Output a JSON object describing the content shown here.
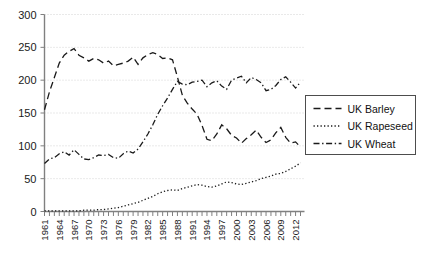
{
  "chart_data": {
    "type": "line",
    "title": "",
    "xlabel": "",
    "ylabel": "",
    "ylim": [
      0,
      300
    ],
    "yticks": [
      0,
      50,
      100,
      150,
      200,
      250,
      300
    ],
    "ytick_labels": [
      "0",
      "50",
      "100",
      "150",
      "200",
      "250",
      "300"
    ],
    "grid": true,
    "legend_position": "right",
    "xlim": [
      1961,
      2013
    ],
    "x": [
      1961,
      1962,
      1963,
      1964,
      1965,
      1966,
      1967,
      1968,
      1969,
      1970,
      1971,
      1972,
      1973,
      1974,
      1975,
      1976,
      1977,
      1978,
      1979,
      1980,
      1981,
      1982,
      1983,
      1984,
      1985,
      1986,
      1987,
      1988,
      1989,
      1990,
      1991,
      1992,
      1993,
      1994,
      1995,
      1996,
      1997,
      1998,
      1999,
      2000,
      2001,
      2002,
      2003,
      2004,
      2005,
      2006,
      2007,
      2008,
      2009,
      2010,
      2011,
      2012,
      2013
    ],
    "xtick_labels": [
      "1961",
      "1964",
      "1967",
      "1970",
      "1973",
      "1976",
      "1979",
      "1982",
      "1985",
      "1988",
      "1991",
      "1994",
      "1997",
      "2000",
      "2003",
      "2006",
      "2009",
      "2012"
    ],
    "xtick_values": [
      1961,
      1964,
      1967,
      1970,
      1973,
      1976,
      1979,
      1982,
      1985,
      1988,
      1991,
      1994,
      1997,
      2000,
      2003,
      2006,
      2009,
      2012
    ],
    "series": [
      {
        "name": "UK Barley",
        "style": "dashed",
        "values": [
          155,
          182,
          204,
          226,
          238,
          244,
          248,
          238,
          234,
          229,
          233,
          231,
          226,
          229,
          222,
          224,
          226,
          229,
          235,
          224,
          234,
          239,
          242,
          239,
          233,
          234,
          231,
          205,
          177,
          165,
          156,
          148,
          131,
          110,
          108,
          118,
          132,
          126,
          116,
          112,
          104,
          111,
          117,
          124,
          113,
          105,
          109,
          120,
          128,
          113,
          104,
          106,
          98
        ]
      },
      {
        "name": "UK Rapeseed",
        "style": "dotted",
        "values": [
          1,
          1,
          1,
          1,
          1,
          1,
          1,
          1,
          2,
          2,
          2,
          3,
          3,
          4,
          5,
          6,
          8,
          10,
          12,
          14,
          17,
          20,
          23,
          27,
          30,
          32,
          33,
          32,
          35,
          37,
          39,
          41,
          40,
          38,
          37,
          39,
          42,
          45,
          44,
          42,
          41,
          43,
          45,
          47,
          50,
          52,
          54,
          57,
          58,
          61,
          65,
          69,
          74
        ]
      },
      {
        "name": "UK Wheat",
        "style": "dashdot",
        "values": [
          73,
          80,
          82,
          88,
          91,
          86,
          94,
          87,
          80,
          79,
          82,
          86,
          85,
          87,
          82,
          81,
          88,
          92,
          89,
          95,
          106,
          118,
          132,
          148,
          161,
          173,
          186,
          198,
          194,
          193,
          197,
          198,
          200,
          190,
          196,
          199,
          191,
          186,
          200,
          203,
          206,
          196,
          204,
          201,
          196,
          184,
          186,
          192,
          201,
          205,
          197,
          188,
          197
        ]
      }
    ]
  },
  "legend": {
    "entries": [
      {
        "label": "UK Barley"
      },
      {
        "label": "UK Rapeseed"
      },
      {
        "label": "UK Wheat"
      }
    ]
  }
}
